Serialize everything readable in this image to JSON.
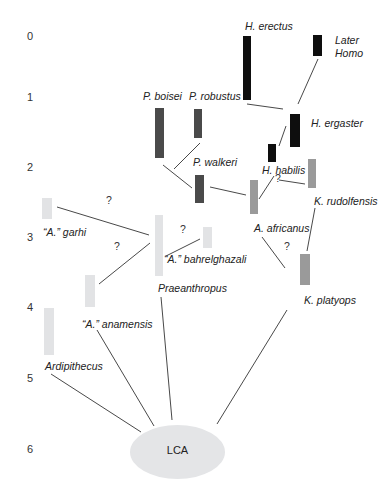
{
  "diagram": {
    "title": "",
    "axis": {
      "unit_label": "",
      "ticks": [
        {
          "value": "0",
          "y": 36
        },
        {
          "value": "1",
          "y": 97
        },
        {
          "value": "2",
          "y": 167
        },
        {
          "value": "3",
          "y": 237
        },
        {
          "value": "4",
          "y": 307
        },
        {
          "value": "5",
          "y": 378
        },
        {
          "value": "6",
          "y": 449
        }
      ]
    },
    "colors": {
      "homo_black": "#0e0e0e",
      "paranthropus_dark": "#4a4a4a",
      "mid_gray": "#9a9a9a",
      "light_gray": "#e2e3e5",
      "lca_fill": "#e4e5e7",
      "line": "#333333"
    },
    "taxa": [
      {
        "id": "h-erectus",
        "label": "H. erectus",
        "bar": {
          "x": 243,
          "y": 36,
          "w": 8,
          "h": 64,
          "color": "#0e0e0e"
        },
        "label_pos": {
          "x": 245,
          "y": 20
        }
      },
      {
        "id": "later-homo",
        "label": "Later Homo",
        "label_lines": [
          "Later",
          "Homo"
        ],
        "bar": {
          "x": 313,
          "y": 35,
          "w": 9,
          "h": 21,
          "color": "#0e0e0e"
        },
        "label_pos": {
          "x": 335,
          "y": 34
        }
      },
      {
        "id": "p-robustus",
        "label": "P. robustus",
        "bar": {
          "x": 194,
          "y": 109,
          "w": 8,
          "h": 29,
          "color": "#4a4a4a"
        },
        "label_pos": {
          "x": 189,
          "y": 90
        }
      },
      {
        "id": "p-boisei",
        "label": "P. boisei",
        "bar": {
          "x": 155,
          "y": 108,
          "w": 9,
          "h": 50,
          "color": "#4a4a4a"
        },
        "label_pos": {
          "x": 143,
          "y": 90
        }
      },
      {
        "id": "h-ergaster",
        "label": "H. ergaster",
        "bar": {
          "x": 290,
          "y": 114,
          "w": 10,
          "h": 33,
          "color": "#0e0e0e"
        },
        "label_pos": {
          "x": 311,
          "y": 117
        }
      },
      {
        "id": "h-habilis",
        "label": "H. habilis",
        "bar": {
          "x": 268,
          "y": 144,
          "w": 8,
          "h": 18,
          "color": "#0e0e0e"
        },
        "label_pos": {
          "x": 262,
          "y": 164
        }
      },
      {
        "id": "p-walkeri",
        "label": "P. walkeri",
        "bar": {
          "x": 195,
          "y": 175,
          "w": 9,
          "h": 28,
          "color": "#4a4a4a"
        },
        "label_pos": {
          "x": 193,
          "y": 156
        }
      },
      {
        "id": "k-rudolfensis",
        "label": "K. rudolfensis",
        "bar": {
          "x": 308,
          "y": 159,
          "w": 8,
          "h": 29,
          "color": "#9a9a9a"
        },
        "label_pos": {
          "x": 314,
          "y": 195
        }
      },
      {
        "id": "a-africanus",
        "label": "A. africanus",
        "bar": {
          "x": 250,
          "y": 180,
          "w": 8,
          "h": 34,
          "color": "#9a9a9a"
        },
        "label_pos": {
          "x": 254,
          "y": 222
        }
      },
      {
        "id": "a-garhi",
        "label": "“A.” garhi",
        "bar": {
          "x": 42,
          "y": 198,
          "w": 10,
          "h": 21,
          "color": "#e2e3e5"
        },
        "label_pos": {
          "x": 43,
          "y": 226
        }
      },
      {
        "id": "praeanthropus",
        "label": "Praeanthropus",
        "bar": {
          "x": 155,
          "y": 215,
          "w": 8,
          "h": 61,
          "color": "#e2e3e5"
        },
        "label_pos": {
          "x": 158,
          "y": 282
        }
      },
      {
        "id": "a-bahrelghazali",
        "label": "“A.” bahrelghazali",
        "bar": {
          "x": 203,
          "y": 227,
          "w": 9,
          "h": 21,
          "color": "#e2e3e5"
        },
        "label_pos": {
          "x": 164,
          "y": 253
        }
      },
      {
        "id": "k-platyops",
        "label": "K. platyops",
        "bar": {
          "x": 300,
          "y": 254,
          "w": 10,
          "h": 31,
          "color": "#9a9a9a"
        },
        "label_pos": {
          "x": 304,
          "y": 294
        }
      },
      {
        "id": "a-anamensis",
        "label": "“A.” anamensis",
        "bar": {
          "x": 85,
          "y": 275,
          "w": 10,
          "h": 32,
          "color": "#e2e3e5"
        },
        "label_pos": {
          "x": 82,
          "y": 318
        }
      },
      {
        "id": "ardipithecus",
        "label": "Ardipithecus",
        "bar": {
          "x": 44,
          "y": 308,
          "w": 10,
          "h": 47,
          "color": "#e2e3e5"
        },
        "label_pos": {
          "x": 45,
          "y": 360
        }
      }
    ],
    "uncertain_marks": [
      {
        "text": "?",
        "x": 106,
        "y": 200
      },
      {
        "text": "?",
        "x": 180,
        "y": 229
      },
      {
        "text": "?",
        "x": 114,
        "y": 246
      },
      {
        "text": "?",
        "x": 275,
        "y": 178
      },
      {
        "text": "?",
        "x": 284,
        "y": 246
      }
    ],
    "edges": [
      {
        "from": "later-homo",
        "to": "h-ergaster",
        "x1": 318,
        "y1": 59,
        "x2": 298,
        "y2": 104
      },
      {
        "from": "h-erectus",
        "to": "h-ergaster",
        "x1": 247,
        "y1": 104,
        "x2": 283,
        "y2": 109
      },
      {
        "from": "h-ergaster",
        "to": "h-habilis",
        "x1": 286,
        "y1": 126,
        "x2": 279,
        "y2": 146
      },
      {
        "from": "p-robustus",
        "to": "p-walkeri-node",
        "x1": 200,
        "y1": 143,
        "x2": 174,
        "y2": 169
      },
      {
        "from": "p-boisei",
        "to": "p-walkeri",
        "x1": 163,
        "y1": 165,
        "x2": 192,
        "y2": 188
      },
      {
        "from": "p-walkeri",
        "to": "a-africanus",
        "x1": 210,
        "y1": 187,
        "x2": 246,
        "y2": 195
      },
      {
        "from": "h-habilis",
        "to": "a-africanus",
        "x1": 274,
        "y1": 176,
        "x2": 259,
        "y2": 199
      },
      {
        "from": "k-rudolfensis",
        "to": "h-habilis-node",
        "x1": 279,
        "y1": 180,
        "x2": 305,
        "y2": 184
      },
      {
        "from": "k-rudolfensis",
        "to": "k-platyops",
        "x1": 315,
        "y1": 208,
        "x2": 307,
        "y2": 251
      },
      {
        "from": "a-africanus",
        "to": "k-platyops",
        "x1": 262,
        "y1": 237,
        "x2": 285,
        "y2": 268
      },
      {
        "from": "a-garhi",
        "to": "praeanthropus",
        "x1": 57,
        "y1": 207,
        "x2": 149,
        "y2": 235
      },
      {
        "from": "a-anamensis",
        "to": "praeanthropus",
        "x1": 99,
        "y1": 284,
        "x2": 150,
        "y2": 243
      },
      {
        "from": "a-bahrelghazali",
        "to": "praeanthropus",
        "x1": 200,
        "y1": 239,
        "x2": 166,
        "y2": 256
      },
      {
        "from": "ardipithecus",
        "to": "lca",
        "x1": 51,
        "y1": 374,
        "x2": 141,
        "y2": 432
      },
      {
        "from": "a-anamensis",
        "to": "lca",
        "x1": 97,
        "y1": 330,
        "x2": 154,
        "y2": 426
      },
      {
        "from": "praeanthropus",
        "to": "lca",
        "x1": 161,
        "y1": 297,
        "x2": 172,
        "y2": 420
      },
      {
        "from": "k-platyops",
        "to": "lca",
        "x1": 287,
        "y1": 310,
        "x2": 217,
        "y2": 424
      }
    ],
    "root": {
      "id": "lca",
      "label": "LCA"
    }
  }
}
